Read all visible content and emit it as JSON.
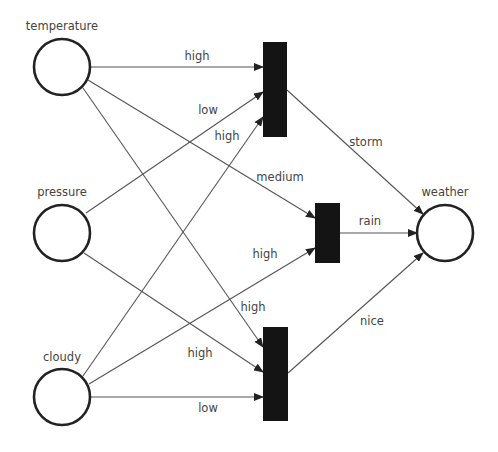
{
  "diagram": {
    "type": "petri-net / neural network",
    "places": [
      {
        "id": "temperature",
        "label": "temperature",
        "cx": 62,
        "cy": 67,
        "r": 28,
        "lx": 62,
        "ly": 30
      },
      {
        "id": "pressure",
        "label": "pressure",
        "cx": 62,
        "cy": 233,
        "r": 28,
        "lx": 62,
        "ly": 196
      },
      {
        "id": "cloudy",
        "label": "cloudy",
        "cx": 62,
        "cy": 397,
        "r": 28,
        "lx": 62,
        "ly": 361
      },
      {
        "id": "weather",
        "label": "weather",
        "cx": 445,
        "cy": 233,
        "r": 28,
        "lx": 445,
        "ly": 196
      }
    ],
    "transitions": [
      {
        "id": "t_storm",
        "x": 263,
        "y": 42,
        "w": 24,
        "h": 95
      },
      {
        "id": "t_rain",
        "x": 315,
        "y": 203,
        "w": 25,
        "h": 60
      },
      {
        "id": "t_nice",
        "x": 263,
        "y": 327,
        "w": 25,
        "h": 94
      }
    ],
    "edges": [
      {
        "from": "temperature",
        "to": "t_storm",
        "x1": 90,
        "y1": 67,
        "x2": 263,
        "y2": 67,
        "label": "high",
        "lx": 197,
        "ly": 60
      },
      {
        "from": "pressure",
        "to": "t_storm",
        "x1": 86,
        "y1": 213,
        "x2": 263,
        "y2": 92,
        "label": "low",
        "lx": 208,
        "ly": 114
      },
      {
        "from": "cloudy",
        "to": "t_storm",
        "x1": 83,
        "y1": 376,
        "x2": 263,
        "y2": 117,
        "label": "high",
        "lx": 227,
        "ly": 140
      },
      {
        "from": "temperature",
        "to": "t_rain",
        "x1": 88,
        "y1": 80,
        "x2": 315,
        "y2": 218,
        "label": "medium",
        "lx": 280,
        "ly": 181
      },
      {
        "from": "cloudy",
        "to": "t_rain",
        "x1": 89,
        "y1": 384,
        "x2": 315,
        "y2": 248,
        "label": "high",
        "lx": 265,
        "ly": 258
      },
      {
        "from": "temperature",
        "to": "t_nice",
        "x1": 83,
        "y1": 88,
        "x2": 263,
        "y2": 347,
        "label": "high",
        "lx": 253,
        "ly": 311
      },
      {
        "from": "pressure",
        "to": "t_nice",
        "x1": 84,
        "y1": 253,
        "x2": 263,
        "y2": 372,
        "label": "high",
        "lx": 200,
        "ly": 357
      },
      {
        "from": "cloudy",
        "to": "t_nice",
        "x1": 90,
        "y1": 397,
        "x2": 263,
        "y2": 397,
        "label": "low",
        "lx": 208,
        "ly": 412
      },
      {
        "from": "t_storm",
        "to": "weather",
        "x1": 287,
        "y1": 90,
        "x2": 423,
        "y2": 214,
        "label": "storm",
        "lx": 366,
        "ly": 146
      },
      {
        "from": "t_rain",
        "to": "weather",
        "x1": 340,
        "y1": 233,
        "x2": 417,
        "y2": 233,
        "label": "rain",
        "lx": 370,
        "ly": 225
      },
      {
        "from": "t_nice",
        "to": "weather",
        "x1": 288,
        "y1": 373,
        "x2": 423,
        "y2": 253,
        "label": "nice",
        "lx": 372,
        "ly": 325
      }
    ]
  },
  "colors": {
    "background": "#ffffff",
    "line": "#555555",
    "node_stroke": "#222222",
    "bar_fill": "#141414",
    "label": "#444444"
  }
}
